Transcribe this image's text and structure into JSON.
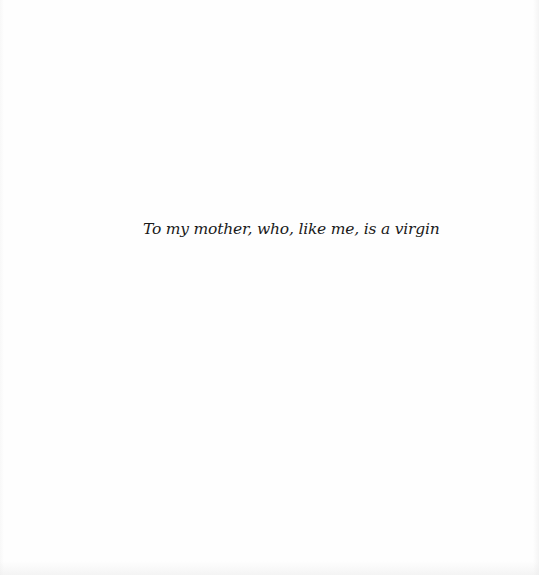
{
  "page": {
    "type": "dedication",
    "dedication_text": "To my mother, who, like me, is a virgin"
  },
  "colors": {
    "background": "#fefefe",
    "text": "#1a1a1a"
  }
}
